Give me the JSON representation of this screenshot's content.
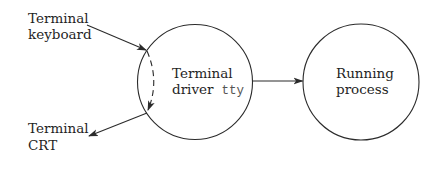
{
  "diagram": {
    "nodes": {
      "keyboard": {
        "line1": "Terminal",
        "line2": "keyboard"
      },
      "crt": {
        "line1": "Terminal",
        "line2": "CRT"
      },
      "driver": {
        "line1": "Terminal",
        "line2": "driver",
        "code": "tty"
      },
      "process": {
        "line1": "Running",
        "line2": "process"
      }
    },
    "edges": [
      {
        "from": "keyboard",
        "to": "driver",
        "style": "solid"
      },
      {
        "from": "driver",
        "to": "crt",
        "style": "solid"
      },
      {
        "from": "driver-input",
        "to": "driver-output",
        "style": "dashed",
        "note": "echo"
      },
      {
        "from": "driver",
        "to": "process",
        "style": "solid"
      }
    ],
    "colors": {
      "stroke": "#2b2b2b",
      "text": "#1f1f1f",
      "code_text": "#555555",
      "background": "#ffffff"
    }
  }
}
